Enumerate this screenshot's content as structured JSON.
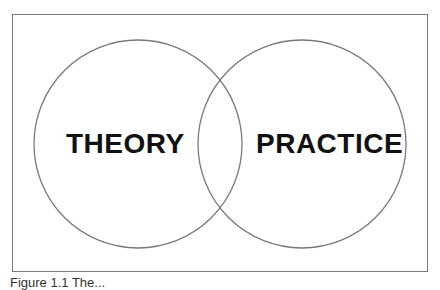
{
  "diagram": {
    "type": "venn",
    "circles": [
      {
        "label": "THEORY",
        "cx": 138,
        "cy": 144,
        "r": 104
      },
      {
        "label": "PRACTICE",
        "cx": 302,
        "cy": 144,
        "r": 104
      }
    ],
    "stroke_color": "#7a7a7a",
    "text_color": "#111111"
  },
  "caption": {
    "text": "Figure 1.1  The..."
  }
}
